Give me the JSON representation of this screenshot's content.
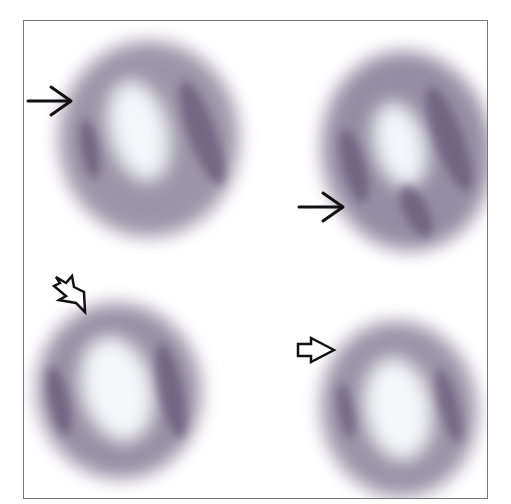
{
  "figure": {
    "panels": [
      {
        "id": "top-left",
        "arrow": "solid-arrow",
        "arrow_direction": "right"
      },
      {
        "id": "top-right",
        "arrow": "solid-arrow",
        "arrow_direction": "right"
      },
      {
        "id": "bottom-left",
        "arrow": "open-arrow",
        "arrow_direction": "down-right"
      },
      {
        "id": "bottom-right",
        "arrow": "open-arrow",
        "arrow_direction": "right"
      }
    ],
    "colors": {
      "uptake_gray": "#8a8498",
      "stripe_purple": "#6a5a7a",
      "stripe_green": "#7a8a6a",
      "frame": "#777777",
      "arrow": "#111111"
    }
  }
}
